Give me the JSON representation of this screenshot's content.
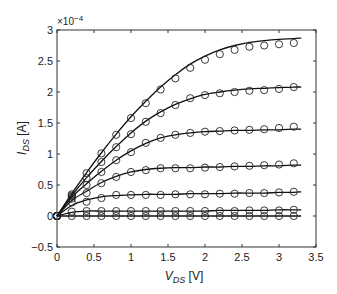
{
  "chart_data": {
    "type": "line",
    "title": "",
    "xlabel": "V_DS [V]",
    "xlabel_main": "V",
    "xlabel_sub": "DS",
    "xlabel_unit": " [V]",
    "ylabel": "I_DS [A]",
    "ylabel_main": "I",
    "ylabel_sub": "DS",
    "ylabel_unit": " [A]",
    "y_multiplier": "×10",
    "y_multiplier_exp": "−4",
    "xlim": [
      0,
      3.5
    ],
    "ylim": [
      -0.5,
      3
    ],
    "xticks": [
      0,
      0.5,
      1,
      1.5,
      2,
      2.5,
      3,
      3.5
    ],
    "xtick_labels": [
      "0",
      "0.5",
      "1",
      "1.5",
      "2",
      "2.5",
      "3",
      "3.5"
    ],
    "yticks": [
      -0.5,
      0,
      0.5,
      1,
      1.5,
      2,
      2.5,
      3
    ],
    "ytick_labels": [
      "−0.5",
      "0",
      "0.5",
      "1",
      "1.5",
      "2",
      "2.5",
      "3"
    ],
    "grid": false,
    "legend": null,
    "units_note": "y values in units of 1e-4 A",
    "x": [
      0,
      0.2,
      0.4,
      0.6,
      0.8,
      1.0,
      1.2,
      1.4,
      1.6,
      1.8,
      2.0,
      2.2,
      2.4,
      2.6,
      2.8,
      3.0,
      3.2
    ],
    "series": [
      {
        "name": "measured-1",
        "marker": "circle",
        "values": [
          0,
          0.35,
          0.69,
          1.01,
          1.31,
          1.58,
          1.82,
          2.04,
          2.22,
          2.39,
          2.52,
          2.61,
          2.68,
          2.73,
          2.75,
          2.77,
          2.79
        ],
        "fit": [
          0,
          0.36,
          0.7,
          1.02,
          1.32,
          1.6,
          1.85,
          2.08,
          2.28,
          2.45,
          2.58,
          2.68,
          2.75,
          2.8,
          2.83,
          2.85,
          2.86,
          2.87
        ]
      },
      {
        "name": "measured-2",
        "marker": "circle",
        "values": [
          0,
          0.33,
          0.61,
          0.87,
          1.11,
          1.32,
          1.52,
          1.66,
          1.79,
          1.9,
          1.95,
          1.98,
          2.0,
          2.02,
          2.03,
          2.05,
          2.08
        ],
        "fit": [
          0,
          0.33,
          0.62,
          0.88,
          1.12,
          1.34,
          1.53,
          1.68,
          1.8,
          1.89,
          1.96,
          2.0,
          2.03,
          2.05,
          2.06,
          2.07,
          2.08,
          2.08
        ]
      },
      {
        "name": "measured-3",
        "marker": "circle",
        "values": [
          0,
          0.31,
          0.5,
          0.71,
          0.9,
          1.03,
          1.18,
          1.26,
          1.31,
          1.34,
          1.36,
          1.37,
          1.38,
          1.39,
          1.4,
          1.42,
          1.44
        ],
        "fit": [
          0,
          0.3,
          0.52,
          0.72,
          0.9,
          1.05,
          1.17,
          1.26,
          1.31,
          1.34,
          1.36,
          1.37,
          1.38,
          1.38,
          1.39,
          1.39,
          1.4,
          1.4
        ]
      },
      {
        "name": "measured-4",
        "marker": "circle",
        "values": [
          0,
          0.28,
          0.37,
          0.53,
          0.63,
          0.71,
          0.74,
          0.77,
          0.77,
          0.77,
          0.78,
          0.79,
          0.8,
          0.81,
          0.82,
          0.83,
          0.85
        ],
        "fit": [
          0,
          0.25,
          0.4,
          0.54,
          0.64,
          0.71,
          0.75,
          0.77,
          0.78,
          0.78,
          0.79,
          0.79,
          0.8,
          0.8,
          0.81,
          0.81,
          0.82,
          0.82
        ]
      },
      {
        "name": "measured-5",
        "marker": "circle",
        "values": [
          0,
          0.22,
          0.23,
          0.29,
          0.34,
          0.34,
          0.34,
          0.34,
          0.35,
          0.35,
          0.35,
          0.36,
          0.36,
          0.37,
          0.37,
          0.38,
          0.39
        ],
        "fit": [
          0,
          0.17,
          0.26,
          0.31,
          0.33,
          0.34,
          0.35,
          0.35,
          0.35,
          0.36,
          0.36,
          0.36,
          0.37,
          0.37,
          0.37,
          0.38,
          0.38,
          0.39
        ]
      },
      {
        "name": "measured-6",
        "marker": "circle",
        "values": [
          0,
          0.07,
          0.08,
          0.08,
          0.08,
          0.08,
          0.08,
          0.08,
          0.08,
          0.08,
          0.08,
          0.08,
          0.08,
          0.09,
          0.09,
          0.09,
          0.1
        ],
        "fit": [
          0,
          0.06,
          0.08,
          0.08,
          0.08,
          0.08,
          0.08,
          0.08,
          0.08,
          0.08,
          0.08,
          0.09,
          0.09,
          0.09,
          0.09,
          0.1,
          0.1,
          0.1
        ]
      },
      {
        "name": "measured-7",
        "marker": "circle",
        "values": [
          0,
          0,
          0,
          0,
          0,
          0,
          0,
          0,
          0,
          0,
          0,
          0,
          0,
          0,
          0,
          0,
          0
        ],
        "fit": [
          0,
          0,
          0,
          0,
          0,
          0,
          0,
          0,
          0,
          0,
          0,
          0,
          0,
          0,
          0,
          0,
          0,
          0
        ]
      }
    ],
    "fit_x": [
      0,
      0.2,
      0.4,
      0.6,
      0.8,
      1.0,
      1.2,
      1.4,
      1.6,
      1.8,
      2.0,
      2.2,
      2.4,
      2.6,
      2.8,
      3.0,
      3.2,
      3.3
    ],
    "colors": {
      "line": "#111111",
      "marker": "#222222",
      "axis": "#333333",
      "background": "#ffffff"
    }
  }
}
